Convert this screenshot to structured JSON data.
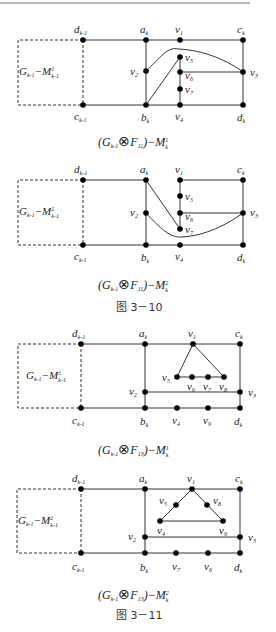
{
  "diagrams": [
    {
      "id": "d1",
      "box_label": {
        "main": "G",
        "sub": "k-1",
        "minus": "−M",
        "sup": "1",
        "sub2": "k-1"
      },
      "caption": {
        "pre": "(G",
        "sub": "k-1",
        "op": "⊗",
        "F": "F",
        "fsub": "11",
        "post": ")−M",
        "sup": "1",
        "msub": "k"
      },
      "vertex_labels": [
        "d_{k-1}",
        "a_k",
        "v_1",
        "c_k",
        "c_{k-1}",
        "b_k",
        "v_4",
        "d_k",
        "v_2",
        "v_5",
        "v_6",
        "v_7",
        "v_3"
      ]
    },
    {
      "id": "d2",
      "box_label": {
        "main": "G",
        "sub": "k-1",
        "minus": "−M",
        "sup": "2",
        "sub2": "k-1"
      },
      "caption": {
        "pre": "(G",
        "sub": "k-1",
        "op": "⊗",
        "F": "F",
        "fsub": "11",
        "post": ")−M",
        "sup": "2",
        "msub": "k"
      },
      "vertex_labels": [
        "d_{k-1}",
        "a_k",
        "v_1",
        "c_k",
        "c_{k-1}",
        "b_k",
        "v_4",
        "d_k",
        "v_2",
        "v_5",
        "v_6",
        "v_7",
        "v_3"
      ]
    },
    {
      "id": "d3",
      "box_label": {
        "main": "G",
        "sub": "k-1",
        "minus": "−M",
        "sup": "1",
        "sub2": "k-1"
      },
      "caption": {
        "pre": "(G",
        "sub": "k-1",
        "op": "⊗",
        "F": "F",
        "fsub": "13",
        "post": ")−M",
        "sup": "1",
        "msub": "k"
      },
      "vertex_labels": [
        "d_{k-1}",
        "a_k",
        "v_1",
        "c_k",
        "c_{k-1}",
        "b_k",
        "v_4",
        "v_9",
        "d_k",
        "v_2",
        "v_3",
        "v_5",
        "v_6",
        "v_7",
        "v_8"
      ]
    },
    {
      "id": "d4",
      "box_label": {
        "main": "G",
        "sub": "k-1",
        "minus": "−M",
        "sup": "2",
        "sub2": "k-1"
      },
      "caption": {
        "pre": "(G",
        "sub": "k-1",
        "op": "⊗",
        "F": "F",
        "fsub": "13",
        "post": ")−M",
        "sup": "2",
        "msub": "k"
      },
      "vertex_labels": [
        "d_{k-1}",
        "a_k",
        "v_1",
        "c_k",
        "c_{k-1}",
        "b_k",
        "v_7",
        "v_6",
        "d_k",
        "v_2",
        "v_3",
        "v_5",
        "v_8",
        "v_4",
        "v_9"
      ]
    }
  ],
  "figure_labels": [
    "图 3－10",
    "图 3－11"
  ],
  "labels": {
    "d": "d",
    "a": "a",
    "c": "c",
    "b": "b",
    "v": "v",
    "k1": "k-1",
    "k": "k",
    "n1": "1",
    "n2": "2",
    "n3": "3",
    "n4": "4",
    "n5": "5",
    "n6": "6",
    "n7": "7",
    "n8": "8",
    "n9": "9"
  }
}
